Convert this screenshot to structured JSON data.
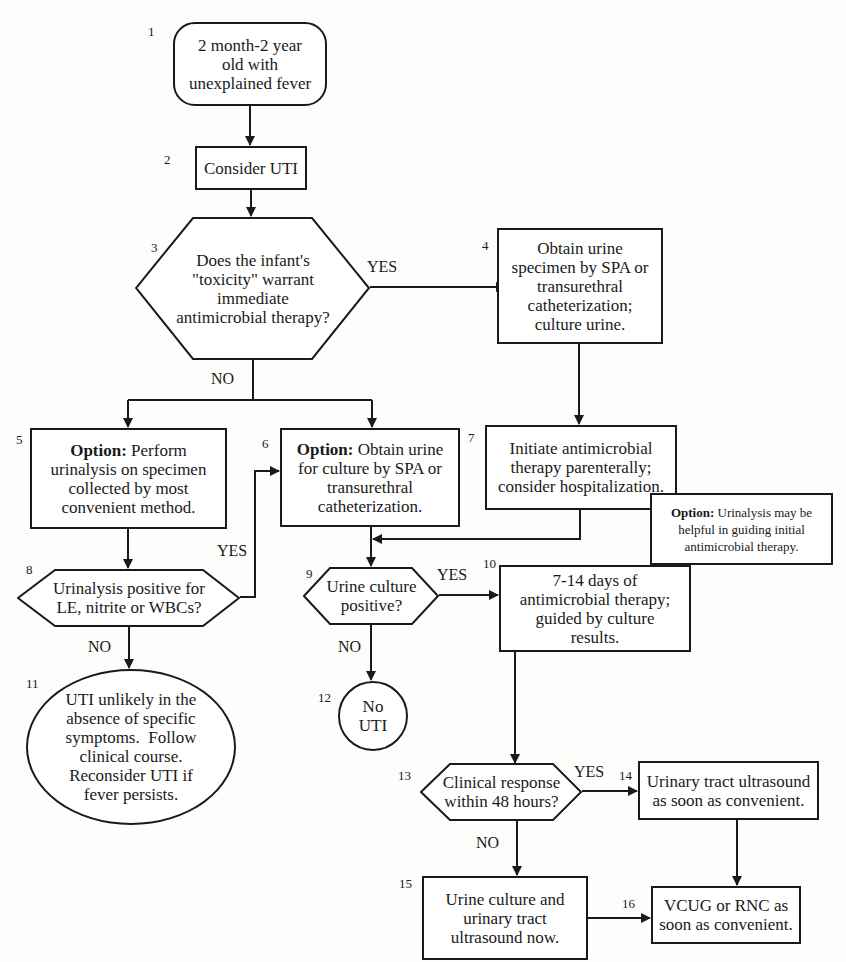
{
  "diagram": {
    "type": "clinical-algorithm-flowchart",
    "nodes": [
      {
        "id": "1",
        "number": "1",
        "shape": "rounded-rect",
        "text": "2 month-2 year old with unexplained fever"
      },
      {
        "id": "2",
        "number": "2",
        "shape": "rect",
        "text": "Consider UTI"
      },
      {
        "id": "3",
        "number": "3",
        "shape": "hexagon",
        "text": "Does the infant's \"toxicity\" warrant immediate antimicrobial therapy?"
      },
      {
        "id": "4",
        "number": "4",
        "shape": "rect",
        "text": "Obtain urine specimen by SPA or transurethral catheterization; culture urine."
      },
      {
        "id": "5",
        "number": "5",
        "shape": "rect",
        "option_label": "Option:",
        "text": "Perform urinalysis on specimen collected by most convenient method."
      },
      {
        "id": "6",
        "number": "6",
        "shape": "rect",
        "option_label": "Option:",
        "text": "Obtain urine for culture by SPA or transurethral catheterization."
      },
      {
        "id": "7",
        "number": "7",
        "shape": "rect",
        "text": "Initiate antimicrobial therapy parenterally; consider hospitalization."
      },
      {
        "id": "7note",
        "number": "",
        "shape": "rect",
        "option_label": "Option:",
        "text": "Urinalysis may be helpful in guiding initial antimicrobial therapy."
      },
      {
        "id": "8",
        "number": "8",
        "shape": "hexagon",
        "text": "Urinalysis positive for LE, nitrite or WBCs?"
      },
      {
        "id": "9",
        "number": "9",
        "shape": "hexagon",
        "text": "Urine culture positive?"
      },
      {
        "id": "10",
        "number": "10",
        "shape": "rect",
        "text": "7-14 days of antimicrobial therapy; guided by culture results."
      },
      {
        "id": "11",
        "number": "11",
        "shape": "ellipse",
        "text": "UTI unlikely in the absence of specific symptoms. Follow clinical course. Reconsider UTI if fever persists."
      },
      {
        "id": "12",
        "number": "12",
        "shape": "circle",
        "text": "No UTI"
      },
      {
        "id": "13",
        "number": "13",
        "shape": "hexagon",
        "text": "Clinical response within 48 hours?"
      },
      {
        "id": "14",
        "number": "14",
        "shape": "rect",
        "text": "Urinary tract ultrasound as soon as convenient."
      },
      {
        "id": "15",
        "number": "15",
        "shape": "rect",
        "text": "Urine culture and urinary tract ultrasound now."
      },
      {
        "id": "16",
        "number": "16",
        "shape": "rect",
        "text": "VCUG or RNC as soon as convenient."
      }
    ],
    "edges": [
      {
        "from": "1",
        "to": "2",
        "label": ""
      },
      {
        "from": "2",
        "to": "3",
        "label": ""
      },
      {
        "from": "3",
        "to": "4",
        "label": "YES"
      },
      {
        "from": "3",
        "to": "5",
        "label": "NO"
      },
      {
        "from": "3",
        "to": "6",
        "label": "NO"
      },
      {
        "from": "4",
        "to": "7",
        "label": ""
      },
      {
        "from": "5",
        "to": "8",
        "label": ""
      },
      {
        "from": "8",
        "to": "6",
        "label": "YES"
      },
      {
        "from": "8",
        "to": "11",
        "label": "NO"
      },
      {
        "from": "6",
        "to": "9",
        "label": ""
      },
      {
        "from": "7",
        "to": "9",
        "label": ""
      },
      {
        "from": "9",
        "to": "10",
        "label": "YES"
      },
      {
        "from": "9",
        "to": "12",
        "label": "NO"
      },
      {
        "from": "10",
        "to": "13",
        "label": ""
      },
      {
        "from": "13",
        "to": "14",
        "label": "YES"
      },
      {
        "from": "13",
        "to": "15",
        "label": "NO"
      },
      {
        "from": "14",
        "to": "16",
        "label": ""
      },
      {
        "from": "15",
        "to": "16",
        "label": ""
      }
    ]
  },
  "labels": {
    "yes": "YES",
    "no": "NO"
  },
  "nodes": {
    "n1": {
      "num": "1",
      "line1": "2 month-2 year",
      "line2": "old with",
      "line3": "unexplained fever"
    },
    "n2": {
      "num": "2",
      "text": "Consider UTI"
    },
    "n3": {
      "num": "3",
      "line1": "Does the infant's",
      "line2": "\"toxicity\" warrant",
      "line3": "immediate",
      "line4": "antimicrobial therapy?"
    },
    "n4": {
      "num": "4",
      "line1": "Obtain urine",
      "line2": "specimen by SPA or",
      "line3": "transurethral",
      "line4": "catheterization;",
      "line5": "culture urine."
    },
    "n5": {
      "num": "5",
      "opt": "Option:",
      "line1": " Perform",
      "line2": "urinalysis on specimen",
      "line3": "collected by most",
      "line4": "convenient method."
    },
    "n6": {
      "num": "6",
      "opt": "Option:",
      "line1": " Obtain urine",
      "line2": "for culture by SPA or",
      "line3": "transurethral",
      "line4": "catheterization."
    },
    "n7": {
      "num": "7",
      "line1": "Initiate antimicrobial",
      "line2": "therapy parenterally;",
      "line3": "consider hospitalization."
    },
    "n7note": {
      "opt": "Option:",
      "line1": " Urinalysis may be",
      "line2": "helpful in guiding initial",
      "line3": "antimicrobial therapy."
    },
    "n8": {
      "num": "8",
      "line1": "Urinalysis positive for",
      "line2": "LE, nitrite or WBCs?"
    },
    "n9": {
      "num": "9",
      "line1": "Urine culture",
      "line2": "positive?"
    },
    "n10": {
      "num": "10",
      "line1": "7-14 days of",
      "line2": "antimicrobial therapy;",
      "line3": "guided by culture",
      "line4": "results."
    },
    "n11": {
      "num": "11",
      "line1": "UTI unlikely in the",
      "line2": "absence of specific",
      "line3": "symptoms.  Follow",
      "line4": "clinical course.",
      "line5": "Reconsider UTI if",
      "line6": "fever persists."
    },
    "n12": {
      "num": "12",
      "line1": "No",
      "line2": "UTI"
    },
    "n13": {
      "num": "13",
      "line1": "Clinical response",
      "line2": "within 48 hours?"
    },
    "n14": {
      "num": "14",
      "line1": "Urinary tract ultrasound",
      "line2": "as soon as convenient."
    },
    "n15": {
      "num": "15",
      "line1": "Urine culture and",
      "line2": "urinary tract",
      "line3": "ultrasound now."
    },
    "n16": {
      "num": "16",
      "line1": "VCUG or RNC as",
      "line2": "soon as convenient."
    }
  }
}
